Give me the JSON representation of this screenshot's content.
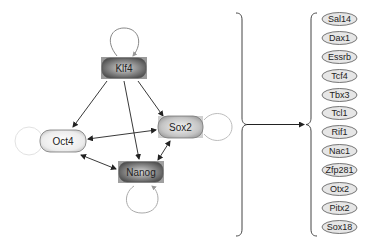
{
  "diagram": {
    "core_network": {
      "nodes": [
        {
          "id": "klf4",
          "label": "Klf4",
          "shade": "dark",
          "self_loop": true
        },
        {
          "id": "oct4",
          "label": "Oct4",
          "shade": "light",
          "self_loop": true
        },
        {
          "id": "sox2",
          "label": "Sox2",
          "shade": "medium",
          "self_loop": true
        },
        {
          "id": "nanog",
          "label": "Nanog",
          "shade": "dark",
          "self_loop": true
        }
      ],
      "edges": [
        {
          "from": "Klf4",
          "to": "Oct4",
          "type": "directed"
        },
        {
          "from": "Klf4",
          "to": "Nanog",
          "type": "directed"
        },
        {
          "from": "Klf4",
          "to": "Sox2",
          "type": "directed"
        },
        {
          "from": "Oct4",
          "to": "Sox2",
          "type": "bidirectional"
        },
        {
          "from": "Oct4",
          "to": "Nanog",
          "type": "bidirectional"
        },
        {
          "from": "Sox2",
          "to": "Nanog",
          "type": "bidirectional"
        }
      ]
    },
    "targets": {
      "items": [
        "Sal14",
        "Dax1",
        "Essrb",
        "Tcf4",
        "Tbx3",
        "Tcl1",
        "Rif1",
        "Nac1",
        "Zfp281",
        "Otx2",
        "Pitx2",
        "Sox18"
      ]
    },
    "colors": {
      "dark_node": "#7a7a7a",
      "medium_node": "#b8b8b8",
      "light_node": "#e6e6e6",
      "edge": "#222222",
      "self_loop": "#bdbdbd"
    }
  }
}
